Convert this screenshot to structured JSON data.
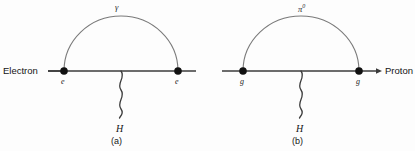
{
  "figure": {
    "background_color": "#fdfdfd",
    "line_color": "#3b3b3b",
    "arc_color": "#6f6f6f",
    "vertex_color": "#111111",
    "panels": [
      {
        "id": "a",
        "caption": "(a)",
        "incoming_label": "Electron",
        "loop_particle": "γ",
        "loop_particle_name": "photon",
        "left_vertex_label": "e",
        "right_vertex_label": "e",
        "emitted_boson": "H",
        "emitted_boson_name": "higgs",
        "geometry": {
          "line_x_start": 8,
          "line_x_end": 196,
          "line_y": 71,
          "left_vertex_x": 64,
          "right_vertex_x": 178,
          "arc_apex_y": 16,
          "wavy_x": 121,
          "wavy_y_end": 118
        }
      },
      {
        "id": "b",
        "caption": "(b)",
        "incoming_label": "Proton",
        "loop_particle": "π",
        "loop_particle_superscript": "0",
        "loop_particle_name": "neutral-pion",
        "left_vertex_label": "g",
        "right_vertex_label": "g",
        "emitted_boson": "H",
        "emitted_boson_name": "higgs",
        "geometry": {
          "line_x_start": 222,
          "line_x_end": 380,
          "line_y": 71,
          "left_vertex_x": 243,
          "right_vertex_x": 359,
          "arc_apex_y": 16,
          "wavy_x": 301,
          "wavy_y_end": 118
        }
      }
    ],
    "cropped_footer_text": "...."
  }
}
